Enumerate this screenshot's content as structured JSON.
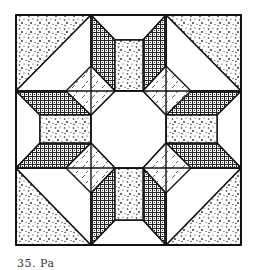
{
  "figure": {
    "type": "quilt-block-pattern",
    "grid": "3x3",
    "caption": "35. Pa"
  },
  "colors": {
    "line": "#111111",
    "background": "#ffffff",
    "stipple": "#222222"
  },
  "fills": {
    "corners": "stipple",
    "center": "white-octagon",
    "diamonds": "dash-hatch",
    "arms": "crosshatch",
    "arm_centers": "stipple"
  }
}
